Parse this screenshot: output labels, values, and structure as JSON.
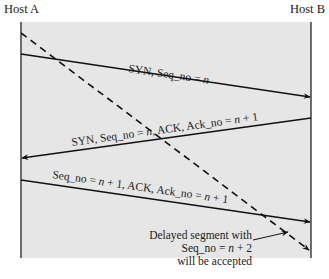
{
  "diagram": {
    "type": "sequence/timing diagram",
    "hosts": [
      {
        "id": "host_a",
        "label": "Host A"
      },
      {
        "id": "host_b",
        "label": "Host B"
      }
    ],
    "messages": [
      {
        "from": "Host A",
        "to": "Host B",
        "label": "SYN, Seq_no = n",
        "style": "solid"
      },
      {
        "from": "Host B",
        "to": "Host A",
        "label": "SYN, Seq_no = n, ACK, Ack_no = n + 1",
        "style": "solid"
      },
      {
        "from": "Host A",
        "to": "Host B",
        "label": "Seq_no = n + 1, ACK, Ack_no = n + 1",
        "style": "solid"
      },
      {
        "from": "Host A",
        "to": "Host B",
        "label": "delayed segment",
        "style": "dashed"
      }
    ],
    "annotation": {
      "lines": [
        "Delayed segment with",
        "Seq_no = n + 2",
        "will be accepted"
      ]
    },
    "colors": {
      "panel": "#e6e6e6",
      "line": "#111111",
      "background": "#ffffff"
    }
  },
  "labels": {
    "host_a": "Host A",
    "host_b": "Host B",
    "msg1_a": "SYN, Seq_no = ",
    "msg1_n": "n",
    "msg2_a": "SYN, Seq_no = ",
    "msg2_n": "n",
    "msg2_b": ", ACK, Ack_no = ",
    "msg2_n2": "n",
    "msg2_c": " + 1",
    "msg3_a": "Seq_no = ",
    "msg3_n": "n",
    "msg3_b": " + 1, ACK, Ack_no = ",
    "msg3_n2": "n",
    "msg3_c": " + 1",
    "note1": "Delayed segment with",
    "note2_a": "Seq_no = ",
    "note2_n": "n",
    "note2_b": " + 2",
    "note3": "will be accepted"
  }
}
